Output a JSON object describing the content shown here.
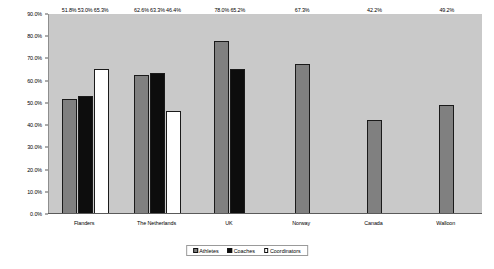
{
  "chart_data": {
    "type": "bar",
    "title": "",
    "subtitle": "",
    "xlabel": "",
    "ylabel": "",
    "ylim": [
      0,
      90
    ],
    "grid": false,
    "legend_position": "bottom-center",
    "y_ticks": [
      "0.0%",
      "10.0%",
      "20.0%",
      "30.0%",
      "40.0%",
      "50.0%",
      "60.0%",
      "70.0%",
      "80.0%",
      "90.0%"
    ],
    "y_tick_values": [
      0,
      10,
      20,
      30,
      40,
      50,
      60,
      70,
      80,
      90
    ],
    "categories": [
      "Flanders",
      "The Netherlands",
      "UK",
      "Norway",
      "Canada",
      "Walloon"
    ],
    "series": [
      {
        "name": "Athletes",
        "color": "#808080",
        "values": [
          51.8,
          62.6,
          78.0,
          67.3,
          42.2,
          49.2
        ],
        "labels": [
          "51.8%",
          "62.6%",
          "78.0%",
          "67.3%",
          "42.2%",
          "49.2%"
        ]
      },
      {
        "name": "Coaches",
        "color": "#0d0d0d",
        "values": [
          53.0,
          63.3,
          65.2,
          null,
          null,
          null
        ],
        "labels": [
          "53.0%",
          "63.3%",
          "65.2%",
          "",
          "",
          ""
        ]
      },
      {
        "name": "Coordinators",
        "color": "#ffffff",
        "values": [
          65.3,
          46.4,
          null,
          null,
          null,
          null
        ],
        "labels": [
          "65.3%",
          "46.4%",
          "",
          "",
          "",
          ""
        ]
      }
    ]
  },
  "legend": {
    "items": [
      {
        "label": "Athletes"
      },
      {
        "label": "Coaches"
      },
      {
        "label": "Coordinators"
      }
    ]
  },
  "colors": {
    "plot_background": "#c9c9c9",
    "page_background": "#ffffff",
    "athletes": "#808080",
    "coaches": "#0d0d0d",
    "coordinators": "#ffffff",
    "axis": "#5a5a5a"
  }
}
